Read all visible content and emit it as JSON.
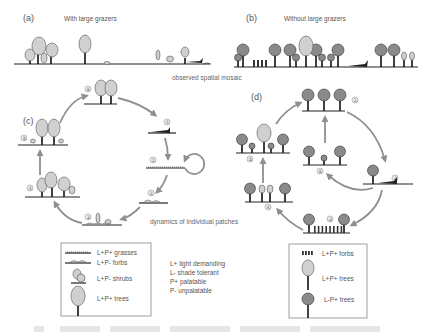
{
  "panels": {
    "a": {
      "letter": "(a)",
      "title": "With large grazers"
    },
    "b": {
      "letter": "(b)",
      "title": "Without large grazers"
    },
    "c": {
      "letter": "(c)"
    },
    "d": {
      "letter": "(d)"
    }
  },
  "captions": {
    "spatial": "observed spatial mosaic",
    "dynamics": "dynamics of individual patches"
  },
  "cycle_c": {
    "stages": [
      "①",
      "②",
      "③",
      "④",
      "⑤",
      "⑥",
      "⑦"
    ]
  },
  "cycle_d": {
    "stages": [
      "①",
      "②",
      "③",
      "④",
      "⑤",
      "⑥"
    ]
  },
  "legend_c": {
    "items": [
      {
        "symbol": "grasses-icon",
        "label": "L+P+ grasses"
      },
      {
        "symbol": "forbs-icon",
        "label": "L+P- forbs"
      },
      {
        "symbol": "shrubs-icon",
        "label": "L+P- shrubs"
      },
      {
        "symbol": "light-tree-icon",
        "label": "L+P+ trees"
      }
    ]
  },
  "key": {
    "items": [
      "L+ light demanding",
      "L- shade tolerant",
      "P+ palatable",
      "P- unpalatable"
    ]
  },
  "legend_d": {
    "items": [
      {
        "symbol": "forbs-icon",
        "label": "L+P+ forbs"
      },
      {
        "symbol": "light-tree-icon",
        "label": "L+P+ trees"
      },
      {
        "symbol": "dark-tree-icon",
        "label": "L-P+ trees"
      }
    ]
  }
}
